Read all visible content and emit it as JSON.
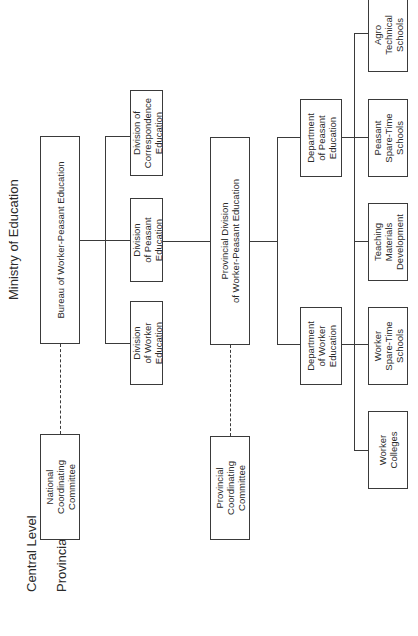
{
  "diagram": {
    "title": "Ministry of Education",
    "levels": {
      "central": "Central Level",
      "provincial": "Provincial Level"
    },
    "central": {
      "bureau": "Bureau of Worker-Peasant Education",
      "coordinating_committee": "National\nCoordinating\nCommittee",
      "divisions": [
        "Division\nof Worker\nEducation",
        "Division\nof Peasant\nEducation",
        "Division of\nCorrespondence\nEducation"
      ]
    },
    "provincial": {
      "division": "Provincial Division\nof Worker-Peasant Education",
      "coordinating_committee": "Provincial\nCoordinating\nCommittee",
      "departments": [
        "Department\nof Worker\nEducation",
        "Department\nof Peasant\nEducation"
      ],
      "units": [
        "Worker\nColleges",
        "Worker\nSpare-Time\nSchools",
        "Teaching\nMaterials\nDevelopment",
        "Peasant\nSpare-Time\nSchools",
        "Agro\nTechnical\nSchools"
      ]
    },
    "line_color": "#3a3a3a"
  }
}
